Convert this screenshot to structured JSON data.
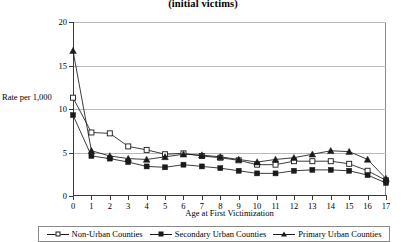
{
  "chart_data": {
    "type": "line",
    "title": "(initial victims)",
    "xlabel": "Age at First Victimization",
    "ylabel": "Rate per 1,000",
    "x": [
      0,
      1,
      2,
      3,
      4,
      5,
      6,
      7,
      8,
      9,
      10,
      11,
      12,
      13,
      14,
      15,
      16,
      17
    ],
    "xtick_labels": [
      "0",
      "1",
      "2",
      "3",
      "4",
      "5",
      "6",
      "7",
      "8",
      "9",
      "10",
      "11",
      "12",
      "13",
      "14",
      "15",
      "16",
      "17"
    ],
    "ytick_labels": [
      "0",
      "5",
      "10",
      "15",
      "20"
    ],
    "yticks": [
      0,
      5,
      10,
      15,
      20
    ],
    "ylim": [
      0,
      20
    ],
    "xlim": [
      0,
      17
    ],
    "grid": true,
    "legend_position": "bottom",
    "series": [
      {
        "name": "Non-Urban Counties",
        "marker": "open-square",
        "values": [
          11.3,
          7.3,
          7.2,
          5.7,
          5.3,
          4.8,
          4.9,
          4.6,
          4.4,
          4.1,
          3.6,
          3.6,
          4.0,
          4.0,
          4.0,
          3.7,
          2.9,
          1.8
        ]
      },
      {
        "name": "Secondary Urban Counties",
        "marker": "filled-square",
        "values": [
          9.3,
          4.6,
          4.3,
          3.9,
          3.4,
          3.3,
          3.6,
          3.4,
          3.2,
          2.9,
          2.6,
          2.6,
          2.9,
          3.0,
          3.0,
          2.9,
          2.4,
          1.5
        ]
      },
      {
        "name": "Primary Urban Counties",
        "marker": "filled-triangle",
        "values": [
          16.7,
          5.2,
          4.6,
          4.3,
          4.2,
          4.5,
          4.8,
          4.7,
          4.5,
          4.2,
          3.9,
          4.2,
          4.4,
          4.8,
          5.2,
          5.1,
          4.2,
          2.0
        ]
      }
    ],
    "colors": {
      "line": "#1a1a1a",
      "grid": "#b9b9b9",
      "axis": "#3a3a3a",
      "background": "#ffffff"
    }
  }
}
